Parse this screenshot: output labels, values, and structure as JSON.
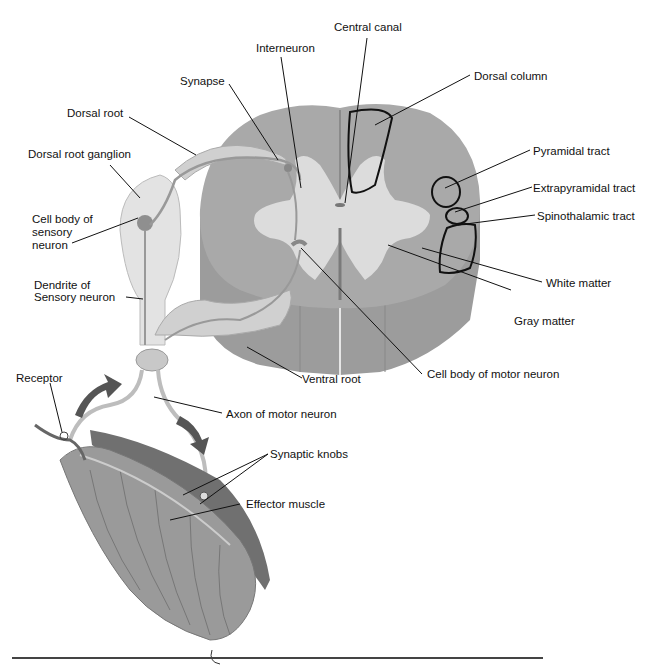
{
  "diagram": {
    "colors": {
      "white_matter": "#a9a9a9",
      "gray_matter": "#dcdcdc",
      "cord_side": "#9c9c9c",
      "nerve": "#cfcfcf",
      "ganglion": "#e3e3e3",
      "muscle": "#9a9a9a",
      "arrow": "#555555",
      "leader": "#111111"
    },
    "labels": {
      "central_canal": "Central canal",
      "interneuron": "Interneuron",
      "dorsal_column": "Dorsal column",
      "synapse": "Synapse",
      "dorsal_root": "Dorsal root",
      "dorsal_root_ganglion": "Dorsal root ganglion",
      "pyramidal_tract": "Pyramidal tract",
      "extrapyramidal_tract": "Extrapyramidal tract",
      "spinothalamic_tract": "Spinothalamic tract",
      "cell_body_sensory_1": "Cell body of",
      "cell_body_sensory_2": "sensory",
      "cell_body_sensory_3": "neuron",
      "white_matter": "White matter",
      "dendrite_sensory_1": "Dendrite of",
      "dendrite_sensory_2": "Sensory neuron",
      "gray_matter": "Gray matter",
      "ventral_root": "Ventral root",
      "cell_body_motor": "Cell body of motor neuron",
      "receptor": "Receptor",
      "axon_motor": "Axon of motor neuron",
      "synaptic_knobs": "Synaptic knobs",
      "effector_muscle": "Effector muscle"
    }
  }
}
